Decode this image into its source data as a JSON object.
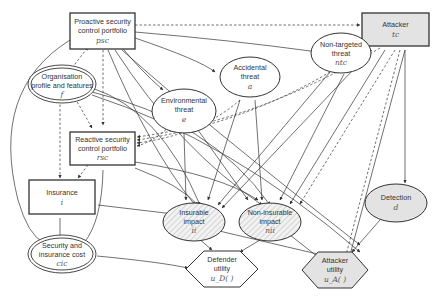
{
  "diagram": {
    "type": "influence-diagram",
    "nodes": {
      "pscp": {
        "line1": "Proactive security",
        "line2": "control portfolio",
        "symbol": "psc",
        "shape": "rectangle"
      },
      "attacker": {
        "line1": "Attacker",
        "symbol": "tc",
        "shape": "rectangle-shaded"
      },
      "ntt": {
        "line1": "Non-targeted",
        "line2": "threat",
        "symbol": "ntc",
        "shape": "ellipse"
      },
      "acc": {
        "line1": "Accidental",
        "line2": "threat",
        "symbol": "a",
        "shape": "ellipse"
      },
      "env": {
        "line1": "Environmental",
        "line2": "threat",
        "symbol": "e",
        "shape": "ellipse"
      },
      "org": {
        "line1": "Organisation",
        "line2": "profile and features",
        "symbol": "f",
        "shape": "double-ellipse"
      },
      "rscp": {
        "line1": "Reactive security",
        "line2": "control portfolio",
        "symbol": "rsc",
        "shape": "rectangle"
      },
      "ins": {
        "line1": "Insurance",
        "symbol": "i",
        "shape": "rectangle"
      },
      "cost": {
        "line1": "Security and",
        "line2": "insurance cost",
        "symbol": "cic",
        "shape": "double-ellipse"
      },
      "ii": {
        "line1": "Insurable",
        "line2": "impact",
        "symbol": "ii",
        "shape": "ellipse-hatched"
      },
      "nii": {
        "line1": "Non-insurable",
        "line2": "impact",
        "symbol": "nii",
        "shape": "ellipse-hatched"
      },
      "det": {
        "line1": "Detection",
        "symbol": "d",
        "shape": "ellipse-shaded"
      },
      "du": {
        "line1": "Defender",
        "line2": "utility",
        "symbol": "u_D( )",
        "shape": "hexagon"
      },
      "au": {
        "line1": "Attacker",
        "line2": "utility",
        "symbol": "u_A( )",
        "shape": "hexagon-shaded"
      }
    },
    "colors": {
      "stroke": "#333333",
      "shaded": "#e3e3e3",
      "text": "#333333",
      "symbol": "#555555"
    }
  }
}
